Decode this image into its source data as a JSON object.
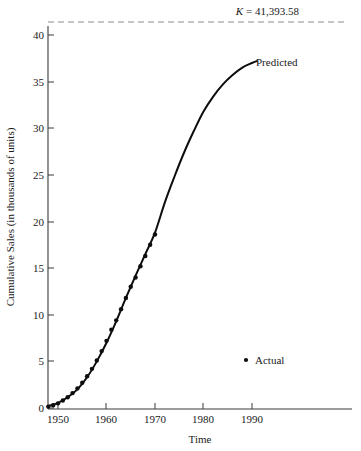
{
  "figure": {
    "background_color": "#ffffff",
    "ink_color": "#0d0d0d"
  },
  "annotations": {
    "k_symbol": "K",
    "k_equation": "= 41,393.58",
    "k_full": "K = 41,393.58",
    "k_value": 41393.58,
    "predicted_label": "Predicted",
    "legend_label": "Actual",
    "legend_marker": "dot-marker"
  },
  "axes": {
    "x_title": "Time",
    "y_title": "Cumulative Sales (in thousands of units)",
    "x_ticks": [
      "1950",
      "1960",
      "1970",
      "1980",
      "1990"
    ],
    "y_ticks": [
      "0",
      "5",
      "10",
      "15",
      "20",
      "25",
      "30",
      "35",
      "40"
    ]
  },
  "chart_data": {
    "type": "line",
    "title": "",
    "subtitle": "",
    "xlabel": "Time",
    "ylabel": "Cumulative Sales (in thousands of units)",
    "xlim": [
      1947.5,
      1998
    ],
    "ylim": [
      0,
      42.5
    ],
    "xticks": [
      1950,
      1960,
      1970,
      1980,
      1990
    ],
    "yticks": [
      0,
      5,
      10,
      15,
      20,
      25,
      30,
      35,
      40
    ],
    "grid": false,
    "legend_position": "lower-right",
    "annotations": [
      {
        "name": "asymptote",
        "text": "K = 41,393.58",
        "type": "horizontal-dashed-line",
        "y": 41.39358
      },
      {
        "name": "predicted-curve-label",
        "text": "Predicted",
        "x": 1991,
        "y": 37.2
      },
      {
        "name": "actual-legend",
        "text": "Actual",
        "x": 1988,
        "y": 4.0
      }
    ],
    "series": [
      {
        "name": "Actual",
        "style": "points",
        "x": [
          1948,
          1949,
          1950,
          1951,
          1952,
          1953,
          1954,
          1955,
          1956,
          1957,
          1958,
          1959,
          1960,
          1961,
          1962,
          1963,
          1964,
          1965,
          1966,
          1967,
          1968,
          1969,
          1970
        ],
        "values": [
          0.15,
          0.3,
          0.5,
          0.8,
          1.15,
          1.6,
          2.1,
          2.7,
          3.4,
          4.2,
          5.1,
          6.1,
          7.2,
          8.4,
          9.4,
          10.6,
          11.8,
          13.0,
          14.0,
          15.2,
          16.3,
          17.5,
          18.6
        ]
      },
      {
        "name": "Predicted",
        "style": "line",
        "x": [
          1948,
          1950,
          1952,
          1954,
          1956,
          1958,
          1960,
          1962,
          1964,
          1966,
          1968,
          1970,
          1972,
          1974,
          1976,
          1978,
          1980,
          1982,
          1984,
          1986,
          1988,
          1990,
          1991
        ],
        "values": [
          0.2,
          0.55,
          1.15,
          2.0,
          3.3,
          5.0,
          7.0,
          9.3,
          11.8,
          14.2,
          16.5,
          18.8,
          22.0,
          24.8,
          27.4,
          29.7,
          31.8,
          33.4,
          34.7,
          35.7,
          36.5,
          37.0,
          37.2
        ]
      }
    ],
    "asymptote": {
      "name": "K",
      "value": 41.39358,
      "label": "K = 41,393.58",
      "style": "dashed"
    }
  }
}
